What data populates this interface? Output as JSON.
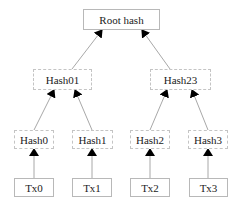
{
  "diagram": {
    "type": "merkle-tree",
    "nodes": {
      "root": "Root hash",
      "hash01": "Hash01",
      "hash23": "Hash23",
      "hash0": "Hash0",
      "hash1": "Hash1",
      "hash2": "Hash2",
      "hash3": "Hash3",
      "tx0": "Tx0",
      "tx1": "Tx1",
      "tx2": "Tx2",
      "tx3": "Tx3"
    },
    "edges": [
      [
        "hash01",
        "root"
      ],
      [
        "hash23",
        "root"
      ],
      [
        "hash0",
        "hash01"
      ],
      [
        "hash1",
        "hash01"
      ],
      [
        "hash2",
        "hash23"
      ],
      [
        "hash3",
        "hash23"
      ],
      [
        "tx0",
        "hash0"
      ],
      [
        "tx1",
        "hash1"
      ],
      [
        "tx2",
        "hash2"
      ],
      [
        "tx3",
        "hash3"
      ]
    ],
    "colors": {
      "edge": "#a8a8a8",
      "arrowhead": "#000000",
      "border": "#b8b8b8"
    }
  }
}
